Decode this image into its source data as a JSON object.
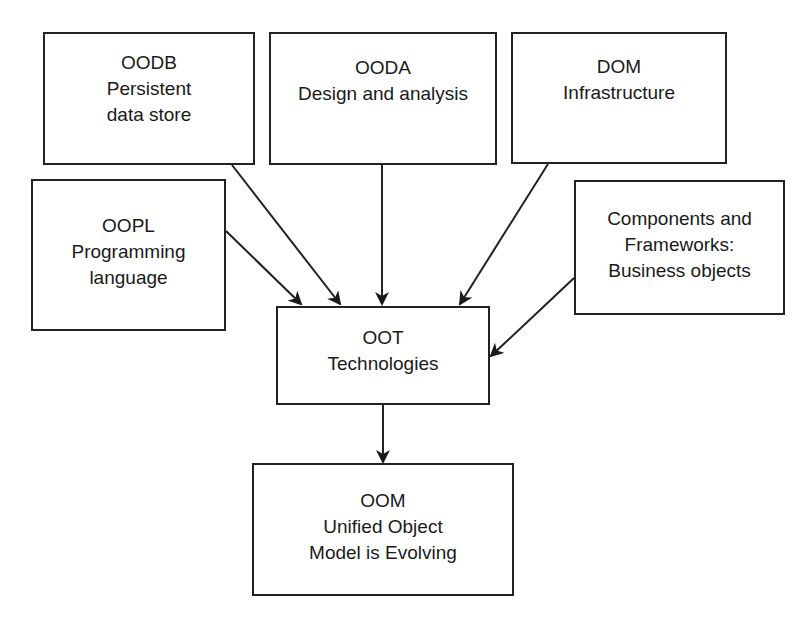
{
  "diagram": {
    "nodes": {
      "oodb": {
        "title": "OODB",
        "line1": "Persistent",
        "line2": "data store"
      },
      "ooda": {
        "title": "OODA",
        "line1": "Design and analysis"
      },
      "dom": {
        "title": "DOM",
        "line1": "Infrastructure"
      },
      "oopl": {
        "title": "OOPL",
        "line1": "Programming",
        "line2": "language"
      },
      "components": {
        "line1": "Components and",
        "line2": "Frameworks:",
        "line3": "Business objects"
      },
      "oot": {
        "title": "OOT",
        "line1": "Technologies"
      },
      "oom": {
        "title": "OOM",
        "line1": "Unified Object",
        "line2": "Model is Evolving"
      }
    },
    "edges": [
      {
        "from": "OOPL",
        "to": "OOT"
      },
      {
        "from": "OODB",
        "to": "OOT"
      },
      {
        "from": "OODA",
        "to": "OOT"
      },
      {
        "from": "DOM",
        "to": "OOT"
      },
      {
        "from": "Components and Frameworks",
        "to": "OOT"
      },
      {
        "from": "OOT",
        "to": "OOM"
      }
    ],
    "colors": {
      "stroke": "#222222",
      "background": "#ffffff",
      "text": "#1a1a1a"
    }
  }
}
